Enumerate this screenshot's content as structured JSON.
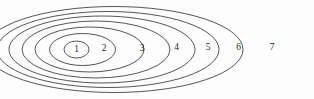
{
  "figure": {
    "name": "nested-ellipses-diagram",
    "background_color": "#fdfdfd",
    "stroke_color": "#2b2b2b",
    "label_color": "#1d1d1d",
    "stroke_width": 0.8,
    "width": 314,
    "height": 99
  },
  "chart_data": {
    "type": "diagram",
    "title": "",
    "subtitle": "",
    "xlabel": "",
    "ylabel": "",
    "shell_count": 7,
    "labels": [
      "1",
      "2",
      "3",
      "4",
      "5",
      "6",
      "7"
    ],
    "shells": [
      {
        "label": "1",
        "cx": 76.5,
        "cy": 49.5,
        "rx": 12.5,
        "ry": 8.5,
        "label_x": 76.5,
        "label_y": 49.5
      },
      {
        "label": "2",
        "cx": 82.5,
        "cy": 49.5,
        "rx": 33.0,
        "ry": 16.0,
        "label_x": 104.0,
        "label_y": 48.5
      },
      {
        "label": "3",
        "cx": 89.5,
        "cy": 49.5,
        "rx": 54.5,
        "ry": 22.5,
        "label_x": 142.0,
        "label_y": 48.5
      },
      {
        "label": "4",
        "cx": 96.0,
        "cy": 49.5,
        "rx": 74.0,
        "ry": 28.5,
        "label_x": 176.5,
        "label_y": 48.0
      },
      {
        "label": "5",
        "cx": 102.0,
        "cy": 49.5,
        "rx": 93.0,
        "ry": 33.5,
        "label_x": 208.0,
        "label_y": 48.0
      },
      {
        "label": "6",
        "cx": 108.0,
        "cy": 49.5,
        "rx": 111.0,
        "ry": 38.0,
        "label_x": 238.5,
        "label_y": 47.5
      },
      {
        "label": "7",
        "cx": 114.0,
        "cy": 49.5,
        "rx": 129.0,
        "ry": 43.0,
        "label_x": 272.0,
        "label_y": 47.5
      }
    ]
  }
}
